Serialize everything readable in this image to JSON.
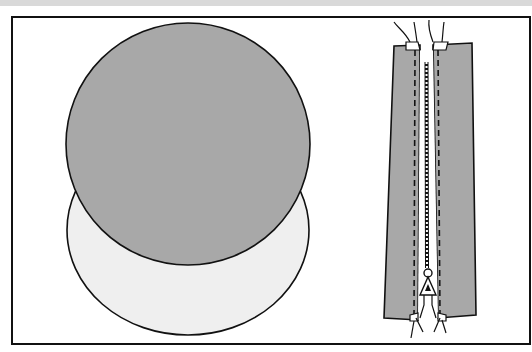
{
  "diagram": {
    "colors": {
      "background": "#ffffff",
      "top_band": "#d9d9d9",
      "fabric_dark": "#a8a8a8",
      "fabric_light": "#efefef",
      "outline": "#111111"
    },
    "elements": [
      {
        "name": "fabric-circle-front",
        "fill": "fabric_dark"
      },
      {
        "name": "fabric-circle-back",
        "fill": "fabric_light"
      },
      {
        "name": "zipper-panel",
        "fill": "fabric_dark"
      }
    ]
  }
}
